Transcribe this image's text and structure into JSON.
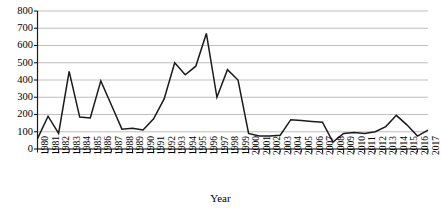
{
  "chart_data": {
    "type": "line",
    "title": "",
    "xlabel": "Year",
    "ylabel": "",
    "grid": true,
    "legend": false,
    "xlim": [
      1980,
      2017
    ],
    "ylim": [
      0,
      800
    ],
    "y_ticks": [
      0,
      100,
      200,
      300,
      400,
      500,
      600,
      700,
      800
    ],
    "y_tick_labels": [
      "0",
      "100",
      "200",
      "300",
      "400",
      "500",
      "600",
      "700",
      "800"
    ],
    "categories": [
      "1980",
      "1981",
      "1982",
      "1983",
      "1984",
      "1985",
      "1986",
      "1987",
      "1988",
      "1989",
      "1990",
      "1991",
      "1992",
      "1993",
      "1994",
      "1995",
      "1996",
      "1997",
      "1998",
      "1999",
      "2000",
      "2001",
      "2002",
      "2003",
      "2004",
      "2005",
      "2006",
      "2007",
      "2008",
      "2009",
      "2010",
      "2011",
      "2012",
      "2013",
      "2014",
      "2015",
      "2016",
      "2017"
    ],
    "values": [
      60,
      190,
      90,
      450,
      185,
      180,
      395,
      255,
      115,
      120,
      110,
      175,
      290,
      500,
      430,
      480,
      670,
      300,
      460,
      400,
      90,
      75,
      75,
      80,
      170,
      165,
      160,
      155,
      40,
      90,
      95,
      90,
      100,
      130,
      195,
      140,
      75,
      110
    ],
    "line_color": "#1a1a1a",
    "grid_color": "#b8b8b8",
    "axis_color": "#1a1a1a",
    "background_color": "#ffffff"
  }
}
